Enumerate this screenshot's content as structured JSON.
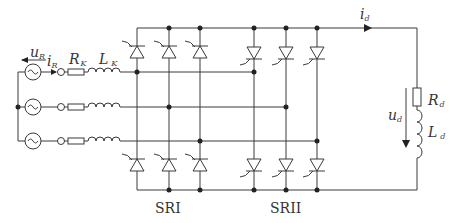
{
  "diagram": {
    "type": "circuit",
    "labels": {
      "source_voltage": "u",
      "source_voltage_sub": "R",
      "source_current": "i",
      "source_current_sub": "R",
      "line_resistance": "R",
      "line_resistance_sub": "K",
      "line_inductance": "L",
      "line_inductance_sub": "K",
      "dc_current": "i",
      "dc_current_sub": "d",
      "load_voltage": "u",
      "load_voltage_sub": "d",
      "load_resistance": "R",
      "load_resistance_sub": "d",
      "load_inductance": "L",
      "load_inductance_sub": "d",
      "bridge1": "SRI",
      "bridge2": "SRII"
    },
    "phases": 3,
    "thyristors_per_bridge": 6
  }
}
